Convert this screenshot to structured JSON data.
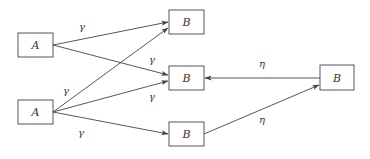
{
  "colors": {
    "stroke": "#444444",
    "text": "#333333",
    "background": "#ffffff"
  },
  "nodes": [
    {
      "id": "a1",
      "label": "A",
      "x": 18,
      "y": 33,
      "w": 35,
      "h": 24
    },
    {
      "id": "a2",
      "label": "A",
      "x": 18,
      "y": 100,
      "w": 35,
      "h": 24
    },
    {
      "id": "b1",
      "label": "B",
      "x": 169,
      "y": 10,
      "w": 35,
      "h": 24
    },
    {
      "id": "b2",
      "label": "B",
      "x": 169,
      "y": 66,
      "w": 35,
      "h": 24
    },
    {
      "id": "b3",
      "label": "B",
      "x": 169,
      "y": 122,
      "w": 35,
      "h": 24
    },
    {
      "id": "b4",
      "label": "B",
      "x": 320,
      "y": 65,
      "w": 34,
      "h": 25
    }
  ],
  "edges": [
    {
      "from": "a1",
      "to": "b1",
      "label": "γ",
      "x1": 53,
      "y1": 45,
      "x2": 168,
      "y2": 22,
      "lx": 82,
      "ly": 30
    },
    {
      "from": "a1",
      "to": "b2",
      "label": "γ",
      "x1": 53,
      "y1": 45,
      "x2": 168,
      "y2": 75,
      "lx": 152,
      "ly": 63
    },
    {
      "from": "a2",
      "to": "b1",
      "label": "γ",
      "x1": 53,
      "y1": 112,
      "x2": 168,
      "y2": 28,
      "lx": 66,
      "ly": 94
    },
    {
      "from": "a2",
      "to": "b2",
      "label": "γ",
      "x1": 53,
      "y1": 112,
      "x2": 168,
      "y2": 81,
      "lx": 152,
      "ly": 100
    },
    {
      "from": "a2",
      "to": "b3",
      "label": "γ",
      "x1": 53,
      "y1": 112,
      "x2": 168,
      "y2": 134,
      "lx": 81,
      "ly": 136
    },
    {
      "from": "b4",
      "to": "b2",
      "label": "η",
      "x1": 320,
      "y1": 78,
      "x2": 205,
      "y2": 78,
      "lx": 262,
      "ly": 67
    },
    {
      "from": "b3",
      "to": "b4",
      "label": "η",
      "x1": 204,
      "y1": 134,
      "x2": 319,
      "y2": 85,
      "lx": 262,
      "ly": 123
    }
  ]
}
